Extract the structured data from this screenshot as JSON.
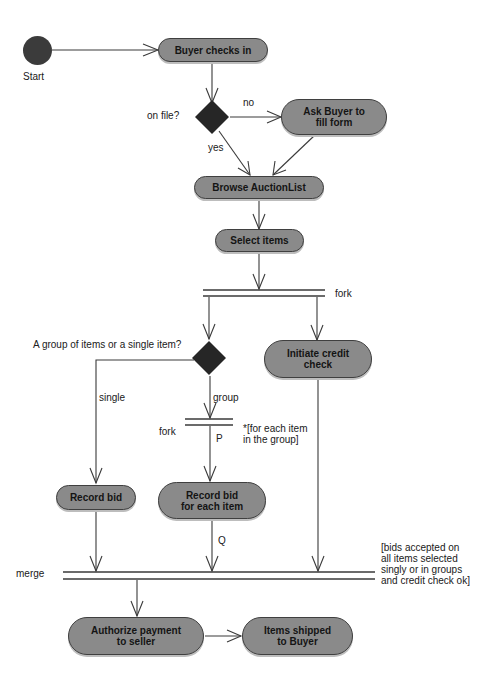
{
  "diagram": {
    "type": "UML activity diagram",
    "start": {
      "label": "Start"
    },
    "activities": {
      "buyer_checks_in": "Buyer checks in",
      "ask_buyer": "Ask Buyer to\nfill form",
      "browse": "Browse AuctionList",
      "select_items": "Select items",
      "initiate_credit": "Initiate credit\ncheck",
      "record_bid": "Record bid",
      "record_bid_each": "Record bid\nfor each item",
      "authorize_payment": "Authorize payment\nto seller",
      "items_shipped": "Items shipped\nto Buyer"
    },
    "decisions": {
      "on_file": "on file?",
      "group_or_single": "A group of items or a single item?"
    },
    "guards": {
      "no": "no",
      "yes": "yes",
      "single": "single",
      "group": "group",
      "p": "P",
      "q": "Q"
    },
    "bars": {
      "fork_top": "fork",
      "fork_inner": "fork",
      "fork_inner_note": "*[for each item\nin the group]",
      "merge": "merge",
      "merge_note": "[bids accepted on\nall items selected\nsingly or in groups\nand credit check ok]"
    }
  },
  "colors": {
    "activity_fill": "#8a8a8a",
    "activity_border": "#3f3f3f",
    "decision_fill": "#262626",
    "start_fill": "#3b3b3b",
    "line": "#3a3a3a"
  }
}
